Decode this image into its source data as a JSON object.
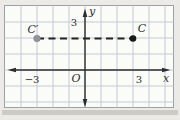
{
  "figure": {
    "type": "coordinate-plane",
    "axis_labels": {
      "x": "x",
      "y": "y",
      "origin": "O"
    },
    "y_axis_ticks": [
      "3"
    ],
    "x_axis_ticks": [
      "−3",
      "3"
    ],
    "points": [
      {
        "name": "C-prime",
        "label": "C′",
        "coords": {
          "x": -3,
          "y": 2
        },
        "color": "#90959a"
      },
      {
        "name": "C",
        "label": "C",
        "coords": {
          "x": 3,
          "y": 2
        },
        "color": "#17181a"
      }
    ],
    "segment": {
      "from": "C′",
      "to": "C",
      "style": "dashed",
      "color": "#232425"
    },
    "colors": {
      "grid_line": "#c3cbd6",
      "axis": "#2c2d2f",
      "plot_background": "#fbfbf8",
      "page_background": "#eceae6",
      "border": "#9aa1a8"
    }
  },
  "grid": {
    "unit_px": 16,
    "origin_px": {
      "x": 85,
      "y": 70
    },
    "vertical_x": [
      21,
      37,
      53,
      69,
      85,
      101,
      117,
      133,
      149,
      165
    ],
    "horizontal_y": [
      22,
      38,
      54,
      70,
      86,
      102
    ],
    "left": 4.5,
    "right": 173.5,
    "top": 5.5,
    "bottom": 107.5
  }
}
